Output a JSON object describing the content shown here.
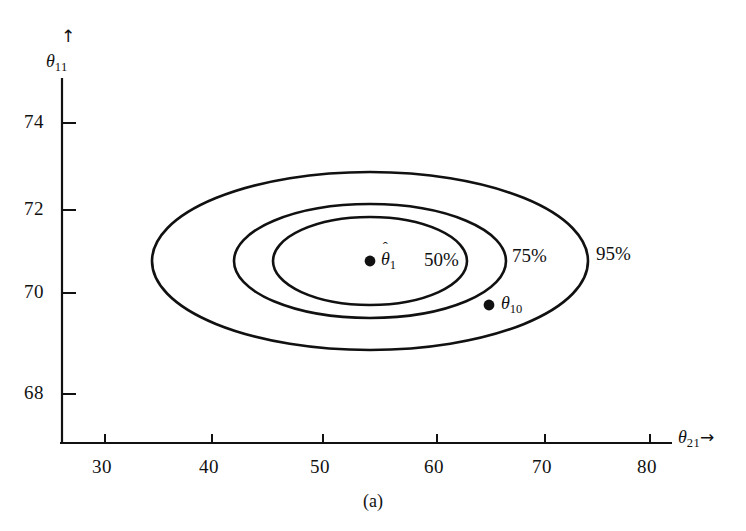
{
  "figure": {
    "caption": "(a)",
    "background_color": "#ffffff",
    "ink_color": "#111111"
  },
  "axes": {
    "x": {
      "title_base": "θ",
      "title_sub": "21",
      "title_arrow": "→",
      "tick_labels": [
        "30",
        "40",
        "50",
        "60",
        "70",
        "80"
      ],
      "tick_values": [
        30,
        40,
        50,
        60,
        70,
        80
      ]
    },
    "y": {
      "title_base": "θ",
      "title_sub": "11",
      "title_arrow": "↑",
      "tick_labels": [
        "68",
        "70",
        "72",
        "74"
      ],
      "tick_values": [
        68,
        70,
        72,
        74
      ]
    }
  },
  "annotations": {
    "contour_labels": [
      "50%",
      "75%",
      "95%"
    ],
    "estimate_point": {
      "symbol_base": "θ",
      "symbol_hat": "ˆ",
      "symbol_sub": "1"
    },
    "true_point": {
      "symbol_base": "θ",
      "symbol_sub": "10"
    }
  },
  "chart_data": {
    "type": "scatter",
    "title": "",
    "subtitle": "",
    "xlabel": "θ_21",
    "ylabel": "θ_11",
    "xlim": [
      25.5,
      83.5
    ],
    "ylim": [
      67.1,
      75.3
    ],
    "grid": false,
    "legend": "none",
    "xticks": [
      30,
      40,
      50,
      60,
      70,
      80
    ],
    "yticks": [
      68,
      70,
      72,
      74
    ],
    "points": [
      {
        "name": "θ̂1 (estimate)",
        "x": 54.0,
        "y": 70.95,
        "marker": "filled-circle",
        "label": "θ̂1"
      },
      {
        "name": "θ₁₀ (true value)",
        "x": 65.0,
        "y": 70.0,
        "marker": "filled-circle",
        "label": "θ₁₀"
      }
    ],
    "contours": [
      {
        "label": "50%",
        "type": "ellipse",
        "center_x": 54.0,
        "center_y": 70.95,
        "semi_axis_x": 8.8,
        "semi_axis_y": 1.0,
        "rotation_deg": 0,
        "label_x": 60.4,
        "label_y": 70.95
      },
      {
        "label": "75%",
        "type": "ellipse",
        "center_x": 54.0,
        "center_y": 70.95,
        "semi_axis_x": 12.3,
        "semi_axis_y": 1.3,
        "rotation_deg": 0,
        "label_x": 64.8,
        "label_y": 70.95
      },
      {
        "label": "95%",
        "type": "ellipse",
        "center_x": 54.0,
        "center_y": 70.95,
        "semi_axis_x": 19.8,
        "semi_axis_y": 2.05,
        "rotation_deg": 0,
        "label_x": 74.8,
        "label_y": 70.95
      }
    ]
  },
  "geometry": {
    "ellipses": [
      {
        "name": "50%",
        "cx": 370,
        "cy": 261,
        "rx": 97,
        "ry": 44
      },
      {
        "name": "75%",
        "cx": 370,
        "cy": 261,
        "rx": 136,
        "ry": 57
      },
      {
        "name": "95%",
        "cx": 370,
        "cy": 261,
        "rx": 218,
        "ry": 89
      }
    ],
    "points": [
      {
        "name": "theta-hat-1",
        "cx": 370,
        "cy": 261,
        "r": 5.4
      },
      {
        "name": "theta-10",
        "cx": 489,
        "cy": 305,
        "r": 5.4
      }
    ],
    "x_axis": {
      "x0": 60,
      "x1": 672,
      "y": 443
    },
    "y_axis": {
      "x": 62,
      "y0": 78,
      "y1": 443
    },
    "x_tick_px": [
      105,
      212,
      323,
      437,
      545,
      650
    ],
    "y_tick_px": [
      394,
      293,
      210,
      123
    ]
  }
}
